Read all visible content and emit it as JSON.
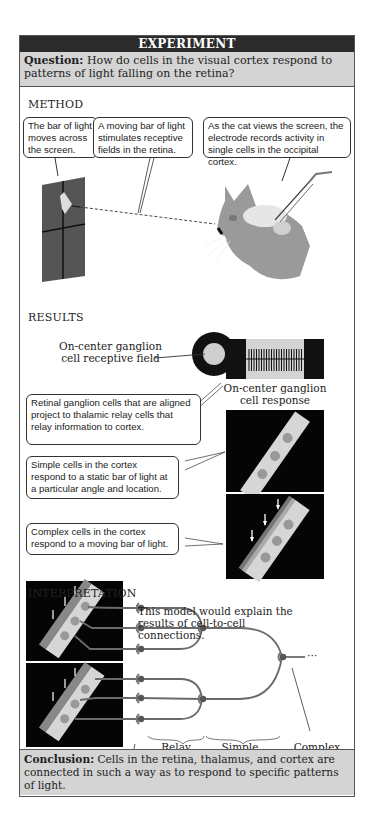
{
  "header": {
    "title": "EXPERIMENT"
  },
  "question": {
    "label": "Question:",
    "text": " How do cells in the visual cortex respond to patterns of light falling on the retina?"
  },
  "method": {
    "title": "METHOD",
    "callouts": [
      "The bar of light moves across the screen.",
      "A moving bar of light stimulates receptive fields in the retina.",
      "As the cat views the screen, the electrode records activity in single cells in the occipital cortex."
    ]
  },
  "results": {
    "title": "RESULTS",
    "receptive_field_label": "On-center ganglion cell receptive field",
    "response_label": "On-center ganglion cell response",
    "callouts": [
      "Retinal ganglion cells that are aligned project to thalamic relay cells that relay information to cortex.",
      "Simple cells in the cortex respond to a static bar of light at a particular angle and location.",
      "Complex cells in the cortex respond to a moving bar of light."
    ]
  },
  "interpretation": {
    "title": "INTERPRETATION",
    "model_text": "This model would explain the results of cell-to-cell connections.",
    "labels": {
      "retinal": "Retinal ganglion cells",
      "relay": "Relay cells in thalamus",
      "simple": "Simple cells in cortex",
      "complex": "Complex cells in cortex"
    },
    "ellipsis": "···"
  },
  "conclusion": {
    "label": "Conclusion:",
    "text": " Cells in the retina, thalamus, and cortex are connected in such a way as to respond to  specific  patterns of light."
  },
  "colors": {
    "header_bg": "#2b2b2b",
    "band_bg": "#d4d4d4",
    "neuron": "#6a6a6a",
    "screen": "#555555"
  }
}
